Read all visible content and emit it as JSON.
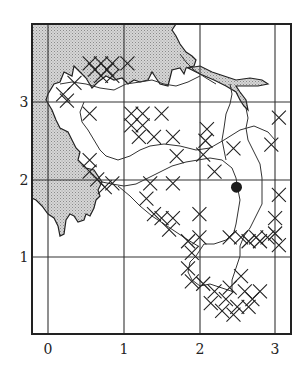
{
  "map": {
    "type": "grid distribution map",
    "x_ticks": [
      "0",
      "1",
      "2",
      "3"
    ],
    "y_ticks": [
      "1",
      "2",
      "3"
    ],
    "legend": [],
    "marker_symbol": "cross (x)",
    "point_marker": "filled black circle",
    "point_location": {
      "x": 2.49,
      "y": 1.9
    },
    "shaded_region": "stippled grey area (sea/water) top-left and along left edge",
    "colors": {
      "ink": "#222222",
      "stipple": "#c8c8c8",
      "background": "#ffffff"
    }
  },
  "chart_data": {
    "type": "scatter",
    "title": "",
    "xlabel": "",
    "ylabel": "",
    "xlim": [
      -0.2,
      3.2
    ],
    "ylim": [
      0,
      3.7
    ],
    "grid": true,
    "x_tick_labels": [
      "0",
      "1",
      "2",
      "3"
    ],
    "y_tick_labels": [
      "1",
      "2",
      "3"
    ],
    "series": [
      {
        "name": "cross markers",
        "marker": "x",
        "points": [
          [
            0.55,
            3.5
          ],
          [
            0.7,
            3.5
          ],
          [
            0.85,
            3.5
          ],
          [
            0.62,
            3.42
          ],
          [
            0.78,
            3.42
          ],
          [
            0.7,
            3.34
          ],
          [
            0.85,
            3.34
          ],
          [
            1.05,
            3.5
          ],
          [
            0.35,
            3.25
          ],
          [
            0.2,
            3.1
          ],
          [
            0.25,
            3.02
          ],
          [
            0.55,
            2.85
          ],
          [
            1.1,
            2.85
          ],
          [
            1.25,
            2.85
          ],
          [
            1.5,
            2.85
          ],
          [
            1.1,
            2.7
          ],
          [
            1.25,
            2.7
          ],
          [
            1.2,
            2.55
          ],
          [
            1.4,
            2.55
          ],
          [
            1.65,
            2.55
          ],
          [
            1.7,
            2.3
          ],
          [
            0.55,
            2.25
          ],
          [
            0.55,
            2.1
          ],
          [
            0.65,
            2.0
          ],
          [
            0.75,
            1.9
          ],
          [
            0.85,
            1.95
          ],
          [
            1.35,
            1.95
          ],
          [
            1.65,
            1.95
          ],
          [
            1.3,
            1.75
          ],
          [
            1.4,
            1.55
          ],
          [
            1.5,
            1.5
          ],
          [
            1.65,
            1.5
          ],
          [
            1.6,
            1.35
          ],
          [
            2.1,
            2.65
          ],
          [
            2.08,
            2.5
          ],
          [
            2.05,
            2.32
          ],
          [
            2.45,
            2.4
          ],
          [
            2.95,
            2.45
          ],
          [
            3.05,
            2.8
          ],
          [
            2.2,
            2.1
          ],
          [
            2.0,
            1.55
          ],
          [
            2.0,
            1.25
          ],
          [
            3.0,
            1.5
          ],
          [
            3.05,
            1.8
          ],
          [
            2.4,
            1.25
          ],
          [
            2.55,
            1.25
          ],
          [
            2.75,
            1.25
          ],
          [
            2.9,
            1.25
          ],
          [
            2.65,
            1.2
          ],
          [
            2.8,
            1.2
          ],
          [
            3.0,
            1.3
          ],
          [
            3.05,
            1.15
          ],
          [
            1.85,
            1.2
          ],
          [
            1.9,
            1.05
          ],
          [
            1.85,
            0.85
          ],
          [
            1.9,
            0.68
          ],
          [
            2.05,
            0.65
          ],
          [
            2.2,
            0.55
          ],
          [
            2.35,
            0.45
          ],
          [
            2.5,
            0.35
          ],
          [
            2.65,
            0.35
          ],
          [
            2.4,
            0.6
          ],
          [
            2.6,
            0.55
          ],
          [
            2.8,
            0.55
          ],
          [
            2.7,
            0.45
          ],
          [
            2.55,
            0.75
          ],
          [
            2.15,
            0.4
          ],
          [
            2.3,
            0.3
          ],
          [
            2.45,
            0.25
          ]
        ]
      },
      {
        "name": "site",
        "marker": "filled circle",
        "points": [
          [
            2.49,
            1.9
          ]
        ]
      }
    ]
  }
}
